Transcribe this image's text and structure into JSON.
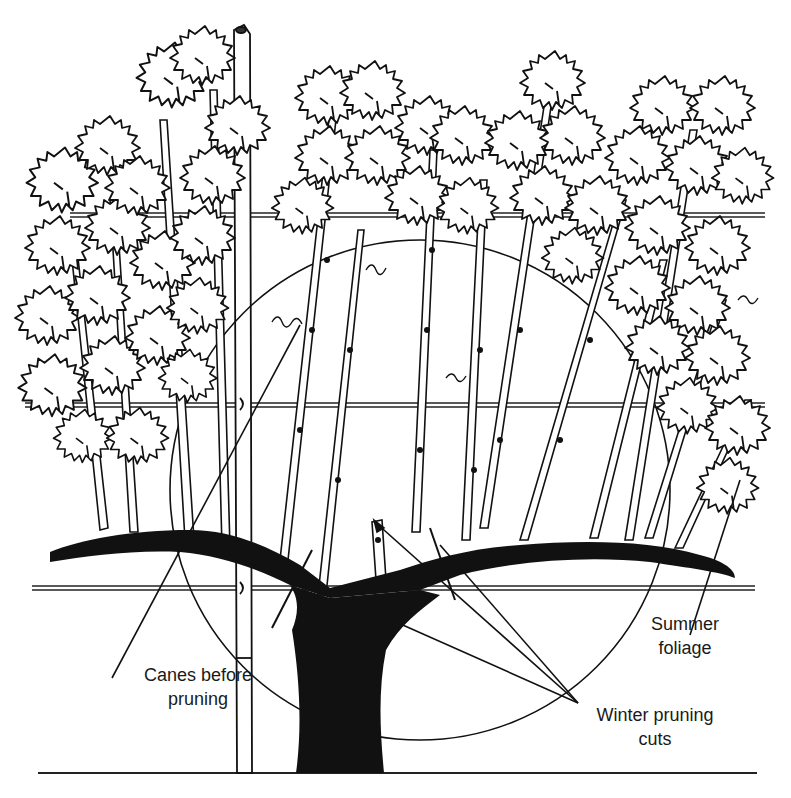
{
  "figure": {
    "colors": {
      "ink": "#111111",
      "background": "#ffffff"
    }
  },
  "labels": {
    "canes_before_pruning": {
      "line1": "Canes before",
      "line2": "pruning"
    },
    "summer_foliage": {
      "line1": "Summer",
      "line2": "foliage"
    },
    "winter_pruning_cuts": {
      "line1": "Winter pruning",
      "line2": "cuts"
    }
  },
  "elements": {
    "trellis_wires": [
      "top wire",
      "middle wire",
      "fruiting wire",
      "ground line"
    ],
    "stake": "trellis stake",
    "trunk": "vine trunk",
    "cordon_arms": "cordon arms",
    "pruning_circle": "area of canes remaining after pruning"
  }
}
